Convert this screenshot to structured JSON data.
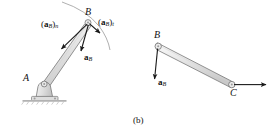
{
  "figure": {
    "caption": "(b)",
    "stroke_color": "#1a1a1a",
    "body_fill": "#e2e2e2",
    "body_stroke": "#6b6b6b",
    "ground_color": "#b9b9b9",
    "path_arc_color": "#8a8a8a"
  },
  "left_diagram": {
    "name": "bar-AB-acceleration-diagram",
    "points": {
      "A": {
        "label": "A",
        "x": 44,
        "y": 84
      },
      "B": {
        "label": "B",
        "x": 88,
        "y": 22
      }
    },
    "support": {
      "type": "pin-support",
      "label": "pin-support-at-A"
    },
    "path_arc": {
      "label": "circular-path-of-B"
    },
    "vectors": [
      {
        "name": "normal-acceleration-B",
        "label_parts": {
          "open": "(",
          "bold": "a",
          "sub1": "B",
          "close": ")",
          "sub2": "n"
        },
        "label_text": "(aB)n",
        "label_x": 41,
        "label_y": 25
      },
      {
        "name": "tangential-acceleration-B",
        "label_parts": {
          "open": "(",
          "bold": "a",
          "sub1": "B",
          "close": ")",
          "sub2": "t"
        },
        "label_text": "(aB)t",
        "label_x": 97,
        "label_y": 22
      },
      {
        "name": "resultant-acceleration-B",
        "label_parts": {
          "bold": "a",
          "sub1": "B"
        },
        "label_text": "aB",
        "label_x": 86,
        "label_y": 57
      }
    ]
  },
  "right_diagram": {
    "name": "link-BC-acceleration-diagram",
    "points": {
      "B": {
        "label": "B",
        "x": 158,
        "y": 46
      },
      "C": {
        "label": "C",
        "x": 232,
        "y": 85
      }
    },
    "vectors": [
      {
        "name": "acceleration-B",
        "label_parts": {
          "bold": "a",
          "sub1": "B"
        },
        "label_text": "aB",
        "label_x": 160,
        "label_y": 82
      },
      {
        "name": "acceleration-C",
        "label_text": "",
        "label_x": 0,
        "label_y": 0
      }
    ]
  }
}
